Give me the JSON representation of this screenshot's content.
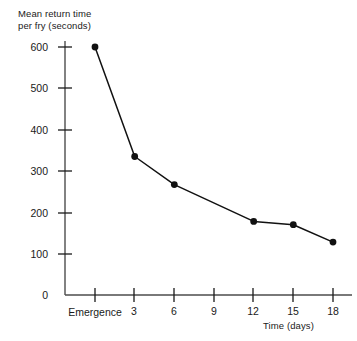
{
  "chart_data": {
    "type": "line",
    "title": "",
    "xlabel": "Time (days)",
    "ylabel": "Mean return time per fry (seconds)",
    "ylabel_line1": "Mean return time",
    "ylabel_line2": "per fry (seconds)",
    "categories": [
      "Emergence",
      "3",
      "6",
      "9",
      "12",
      "15",
      "18"
    ],
    "x": [
      0,
      3,
      6,
      9,
      12,
      15,
      18
    ],
    "x_tick_labels": [
      "Emergence",
      "3",
      "6",
      "9",
      "12",
      "15",
      "18"
    ],
    "y_tick_labels": [
      "600",
      "500",
      "400",
      "300",
      "200",
      "100",
      "0"
    ],
    "y_ticks": [
      600,
      500,
      400,
      300,
      200,
      100,
      0
    ],
    "values": [
      600,
      335,
      267,
      null,
      178,
      170,
      128
    ],
    "series": [
      {
        "name": "Mean return time per fry",
        "points": [
          {
            "x": 0,
            "x_label": "Emergence",
            "y": 600
          },
          {
            "x": 3,
            "x_label": "3",
            "y": 335
          },
          {
            "x": 6,
            "x_label": "6",
            "y": 267
          },
          {
            "x": 12,
            "x_label": "12",
            "y": 178
          },
          {
            "x": 15,
            "x_label": "15",
            "y": 170
          },
          {
            "x": 18,
            "x_label": "18",
            "y": 128
          }
        ]
      }
    ],
    "xlim": [
      0,
      18
    ],
    "ylim": [
      0,
      600
    ],
    "grid": false,
    "legend": false,
    "legend_position": "none",
    "line_color": "#111111",
    "marker_color": "#111111",
    "axis_color": "#4d4d4d",
    "background_color": "#ffffff"
  }
}
